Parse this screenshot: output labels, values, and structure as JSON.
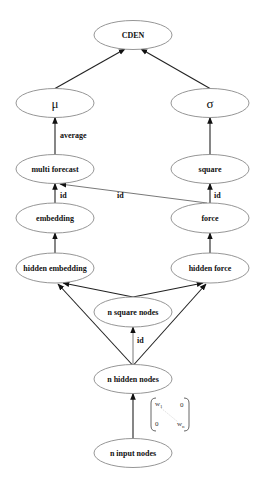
{
  "diagram": {
    "nodes": [
      {
        "id": "cden",
        "label": "CDEN"
      },
      {
        "id": "mu",
        "label": "μ",
        "greek": true
      },
      {
        "id": "sigma",
        "label": "σ",
        "greek": true
      },
      {
        "id": "multi_forecast",
        "label": "multi forecast"
      },
      {
        "id": "square",
        "label": "square"
      },
      {
        "id": "embedding",
        "label": "embedding"
      },
      {
        "id": "force",
        "label": "force"
      },
      {
        "id": "hidden_embedding",
        "label": "hidden embedding"
      },
      {
        "id": "hidden_force",
        "label": "hidden force"
      },
      {
        "id": "n_square_nodes",
        "label": "n square nodes"
      },
      {
        "id": "n_hidden_nodes",
        "label": "n hidden nodes"
      },
      {
        "id": "n_input_nodes",
        "label": "n input nodes"
      }
    ],
    "edges": [
      {
        "from": "mu",
        "to": "cden",
        "label": ""
      },
      {
        "from": "sigma",
        "to": "cden",
        "label": ""
      },
      {
        "from": "multi_forecast",
        "to": "mu",
        "label": "average"
      },
      {
        "from": "square",
        "to": "sigma",
        "label": ""
      },
      {
        "from": "embedding",
        "to": "multi_forecast",
        "label": "id"
      },
      {
        "from": "force",
        "to": "multi_forecast",
        "label": "id"
      },
      {
        "from": "force",
        "to": "square",
        "label": "id"
      },
      {
        "from": "hidden_embedding",
        "to": "embedding",
        "label": ""
      },
      {
        "from": "hidden_force",
        "to": "force",
        "label": ""
      },
      {
        "from": "n_square_nodes",
        "to": "hidden_embedding",
        "label": ""
      },
      {
        "from": "n_square_nodes",
        "to": "hidden_force",
        "label": ""
      },
      {
        "from": "n_hidden_nodes",
        "to": "hidden_embedding",
        "label": ""
      },
      {
        "from": "n_hidden_nodes",
        "to": "hidden_force",
        "label": ""
      },
      {
        "from": "n_hidden_nodes",
        "to": "n_square_nodes",
        "label": "id"
      },
      {
        "from": "n_input_nodes",
        "to": "n_hidden_nodes",
        "label": ""
      }
    ],
    "weight_matrix": {
      "top_left": "w",
      "top_left_sub": "1",
      "top_right": "0",
      "bottom_left": "0",
      "bottom_right": "w",
      "bottom_right_sub": "n"
    },
    "edge_labels": {
      "average": "average",
      "id_embedding": "id",
      "id_cross": "id",
      "id_force": "id",
      "id_hidden": "id"
    }
  }
}
